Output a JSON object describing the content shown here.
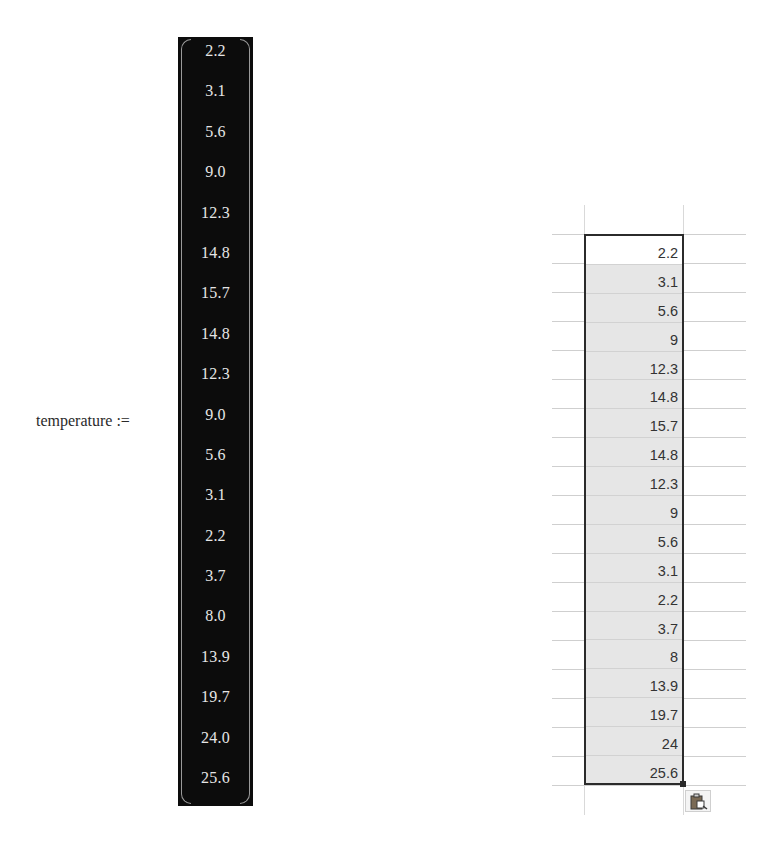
{
  "matrix_panel": {
    "variable_name": "temperature",
    "assign_operator": ":=",
    "values": [
      "2.2",
      "3.1",
      "5.6",
      "9.0",
      "12.3",
      "14.8",
      "15.7",
      "14.8",
      "12.3",
      "9.0",
      "5.6",
      "3.1",
      "2.2",
      "3.7",
      "8.0",
      "13.9",
      "19.7",
      "24.0",
      "25.6"
    ]
  },
  "spreadsheet_panel": {
    "selected_range_rows": 19,
    "active_cell_value": "2.2",
    "values": [
      "2.2",
      "3.1",
      "5.6",
      "9",
      "12.3",
      "14.8",
      "15.7",
      "14.8",
      "12.3",
      "9",
      "5.6",
      "3.1",
      "2.2",
      "3.7",
      "8",
      "13.9",
      "19.7",
      "24",
      "25.6"
    ],
    "paste_options_icon": "clipboard-paste-icon"
  },
  "colors": {
    "matrix_background": "#0c0c0c",
    "matrix_text": "#e6e6e6",
    "selection_border": "#2b2b2b",
    "selection_fill": "#e6e6e6",
    "gridline": "#cfcfcf"
  }
}
